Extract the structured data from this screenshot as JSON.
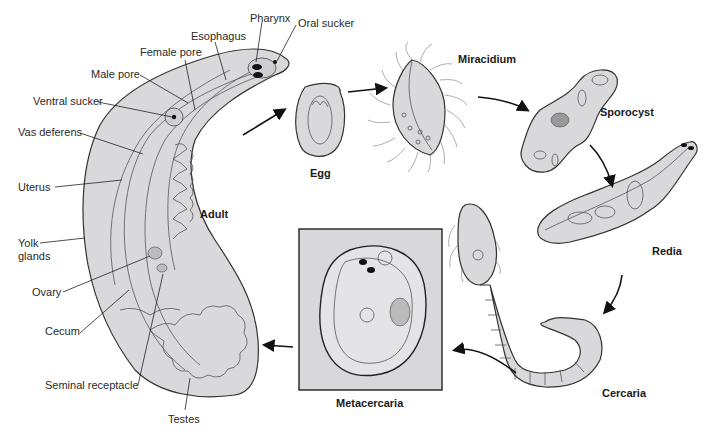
{
  "adult": {
    "stage_label": "Adult",
    "labels": {
      "pharynx": "Pharynx",
      "oral_sucker": "Oral sucker",
      "esophagus": "Esophagus",
      "female_pore": "Female pore",
      "male_pore": "Male pore",
      "ventral_sucker": "Ventral sucker",
      "vas_deferens": "Vas deferens",
      "uterus": "Uterus",
      "yolk_glands_1": "Yolk",
      "yolk_glands_2": "glands",
      "ovary": "Ovary",
      "cecum": "Cecum",
      "seminal_receptacle": "Seminal receptacle",
      "testes": "Testes"
    }
  },
  "stages": {
    "egg": "Egg",
    "miracidium": "Miracidium",
    "sporocyst": "Sporocyst",
    "redia": "Redia",
    "cercaria": "Cercaria",
    "metacercaria": "Metacercaria"
  },
  "colors": {
    "body_fill": "#d9d9db",
    "outline": "#333333",
    "text": "#1a1a1a"
  }
}
